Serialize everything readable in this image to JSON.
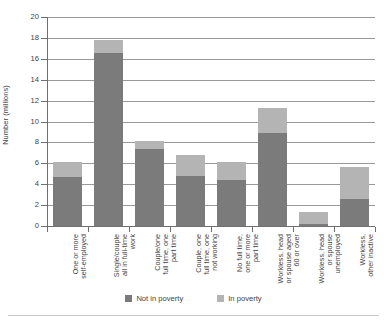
{
  "chart_data": {
    "type": "bar",
    "title": "",
    "subtitle": "",
    "xlabel": "",
    "ylabel": "Number (millions)",
    "ylim": [
      0,
      20
    ],
    "yticks": [
      0,
      2,
      4,
      6,
      8,
      10,
      12,
      14,
      16,
      18,
      20
    ],
    "grid": true,
    "stacked": true,
    "legend_position": "bottom",
    "categories": [
      "One or more\nself-employed",
      "Single/couple\nall in full-time\nwork",
      "Couple/one\nfull time, one\npart time",
      "Couple, one\nfull time, one\nnot working",
      "No full time,\none or more\npart time",
      "Workless, head\nor spouse aged\n60 or over",
      "Workless, head\nor spouse\nunemployed",
      "Workless,\nother inactive"
    ],
    "series": [
      {
        "name": "Not in poverty",
        "color": "#7b7b7b",
        "values": [
          4.7,
          16.6,
          7.4,
          4.8,
          4.4,
          8.9,
          0.2,
          2.6
        ]
      },
      {
        "name": "In poverty",
        "color": "#b4b4b4",
        "values": [
          1.4,
          1.2,
          0.7,
          2.0,
          1.7,
          2.4,
          1.1,
          3.0
        ]
      }
    ],
    "totals": [
      6.1,
      17.8,
      8.1,
      6.8,
      6.1,
      11.3,
      1.3,
      5.6
    ]
  },
  "legend": {
    "items": [
      {
        "label": "Not in poverty",
        "color": "#7b7b7b"
      },
      {
        "label": "In poverty",
        "color": "#b4b4b4"
      }
    ]
  }
}
